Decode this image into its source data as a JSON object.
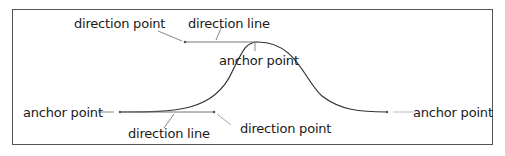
{
  "labels": {
    "top_direction_point": "direction point",
    "top_direction_line": "direction line",
    "top_anchor_point": "anchor point",
    "left_anchor_point": "anchor point",
    "bottom_direction_line": "direction line",
    "bottom_direction_point": "direction point",
    "right_anchor_point": "anchor point"
  },
  "colors": {
    "curve": "#333333",
    "direction_line": "#777777",
    "leader": "#888888",
    "frame": "#555555"
  }
}
